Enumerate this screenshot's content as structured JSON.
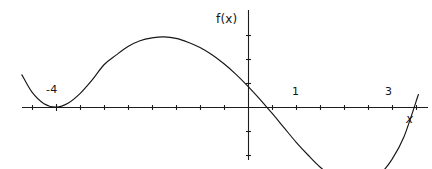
{
  "figure": {
    "width": 432,
    "height": 169,
    "background_color": "#ffffff",
    "curve_color": "#161616",
    "axis_color": "#1c1c1c"
  },
  "labels": {
    "function_label": "f(x)",
    "x_axis_label": "x",
    "root_minus_four": "-4",
    "root_one": "1",
    "root_three": "3"
  },
  "chart_data": {
    "type": "line",
    "title": "",
    "xlabel": "x",
    "ylabel": "f(x)",
    "grid": false,
    "legend": null,
    "axes": {
      "origin_px": [
        248,
        107
      ],
      "pixels_per_unit_x": 48,
      "pixels_per_unit_y": 48,
      "x_axis_y_px": 107,
      "y_axis_x_px": 248,
      "x_axis_extent_px": [
        22,
        428
      ],
      "y_axis_extent_px": [
        10,
        160
      ],
      "xlim": [
        -4.7,
        3.75
      ],
      "ylim": [
        -1.95,
        2.0
      ],
      "x_tick_step": 0.5,
      "y_tick_step": 0.5,
      "x_tick_values": [
        -4.5,
        -4,
        -3.5,
        -3,
        -2.5,
        -2,
        -1.5,
        -1,
        -0.5,
        0,
        0.5,
        1,
        1.5,
        2,
        2.5,
        3,
        3.5
      ],
      "y_tick_values": [
        -1.5,
        -1,
        -0.5,
        0.5,
        1,
        1.5
      ],
      "tick_length_px": 5
    },
    "annotations": [
      {
        "text": "f(x)",
        "x_px": 216,
        "y_px": 13,
        "role": "y-axis-name"
      },
      {
        "text": "x",
        "x_px": 406,
        "y_px": 113,
        "role": "x-axis-name"
      },
      {
        "text": "-4",
        "x_px": 46,
        "y_px": 84,
        "role": "root-label",
        "x_value": -4
      },
      {
        "text": "1",
        "x_px": 292,
        "y_px": 86,
        "role": "root-label",
        "x_value": 1
      },
      {
        "text": "3",
        "x_px": 385,
        "y_px": 86,
        "role": "root-label",
        "x_value": 3
      }
    ],
    "roots": [
      {
        "x": -4,
        "multiplicity": 2,
        "label": "-4",
        "touches_axis": true
      },
      {
        "x": 1,
        "multiplicity": 1,
        "label": "1",
        "touches_axis": false
      },
      {
        "x": 3,
        "multiplicity": 1,
        "label": "3",
        "touches_axis": false
      }
    ],
    "features": {
      "y_intercept": 1.0,
      "local_maximum": {
        "x": -1.3,
        "y": 1.44
      },
      "local_minimum_left": {
        "x": -4,
        "y": 0
      },
      "local_minimum_right": {
        "x": 2.2,
        "y": -0.79
      },
      "end_behaviour_left": "rising",
      "end_behaviour_right": "rising",
      "degree": 4,
      "leading_coefficient": 0.02083
    },
    "equation": "f(x) = (1/48)(x+4)^2(x-1)(x-3)",
    "x": [
      -4.71,
      -4.5,
      -4.25,
      -4.0,
      -3.75,
      -3.5,
      -3.25,
      -3.0,
      -2.75,
      -2.5,
      -2.25,
      -2.0,
      -1.75,
      -1.5,
      -1.25,
      -1.0,
      -0.75,
      -0.5,
      -0.25,
      0.0,
      0.25,
      0.5,
      0.75,
      1.0,
      1.25,
      1.5,
      1.75,
      2.0,
      2.25,
      2.5,
      2.75,
      3.0,
      3.25,
      3.55
    ],
    "y": [
      0.67,
      0.31,
      0.07,
      0.0,
      0.08,
      0.28,
      0.56,
      0.88,
      1.08,
      1.26,
      1.38,
      1.44,
      1.46,
      1.43,
      1.35,
      1.24,
      1.09,
      0.9,
      0.68,
      0.43,
      0.16,
      -0.13,
      -0.43,
      -0.73,
      -1.0,
      -1.25,
      -1.44,
      -1.57,
      -1.62,
      -1.57,
      -1.4,
      -1.09,
      -0.62,
      0.26
    ],
    "values": [
      0.67,
      0.31,
      0.07,
      0.0,
      0.08,
      0.28,
      0.56,
      0.88,
      1.08,
      1.26,
      1.38,
      1.44,
      1.46,
      1.43,
      1.35,
      1.24,
      1.09,
      0.9,
      0.68,
      0.43,
      0.16,
      -0.13,
      -0.43,
      -0.73,
      -1.0,
      -1.25,
      -1.44,
      -1.57,
      -1.62,
      -1.57,
      -1.4,
      -1.09,
      -0.62,
      0.26
    ]
  }
}
